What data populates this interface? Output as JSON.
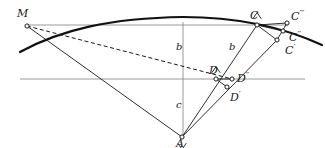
{
  "figure": {
    "width": 325,
    "height": 148,
    "background": "#ffffff",
    "ink_color": "#1a1a1a",
    "axis_color": "#808080",
    "curve_color": "#111111"
  },
  "points": {
    "M": {
      "label": "M",
      "x": 27,
      "y": 26
    },
    "A": {
      "label": "A",
      "x": 182,
      "y": 137
    },
    "C": {
      "label": "C",
      "x": 257,
      "y": 25
    },
    "Cp": {
      "label": "C′",
      "x": 277,
      "y": 40
    },
    "Cpp": {
      "label": "C″",
      "x": 283,
      "y": 31
    },
    "Cppp": {
      "label": "C‴",
      "x": 287,
      "y": 23
    },
    "D": {
      "label": "D",
      "x": 216,
      "y": 79
    },
    "Dp": {
      "label": "D′",
      "x": 227,
      "y": 87
    },
    "Dpp": {
      "label": "D″",
      "x": 232,
      "y": 79
    }
  },
  "point_labels": [
    {
      "name": "label-M",
      "text": "M",
      "primes": "",
      "x": 17,
      "y": 8
    },
    {
      "name": "label-A",
      "text": "A",
      "primes": "",
      "x": 176,
      "y": 138
    },
    {
      "name": "label-C",
      "text": "C",
      "primes": "",
      "x": 250,
      "y": 10
    },
    {
      "name": "label-Cppp",
      "text": "C",
      "primes": "′′′",
      "x": 291,
      "y": 9
    },
    {
      "name": "label-Cpp",
      "text": "C",
      "primes": "′′",
      "x": 289,
      "y": 30
    },
    {
      "name": "label-Cp",
      "text": "C",
      "primes": "′",
      "x": 285,
      "y": 43
    },
    {
      "name": "label-D",
      "text": "D",
      "primes": "",
      "x": 209,
      "y": 65
    },
    {
      "name": "label-Dpp",
      "text": "D",
      "primes": "′′",
      "x": 237,
      "y": 71
    },
    {
      "name": "label-Dp",
      "text": "D",
      "primes": "′",
      "x": 230,
      "y": 90
    }
  ],
  "segment_labels": [
    {
      "name": "label-b-vertical",
      "text": "b",
      "x": 176,
      "y": 42
    },
    {
      "name": "label-b-diagonal",
      "text": "b",
      "x": 229,
      "y": 42
    },
    {
      "name": "label-c-vertical",
      "text": "c",
      "x": 176,
      "y": 100
    }
  ],
  "axes": {
    "horizontal_top": {
      "name": "horizontal-line-through-M-C",
      "x1": 27,
      "y1": 25,
      "x2": 288,
      "y2": 25
    },
    "horizontal_bottom": {
      "name": "horizontal-line-through-D",
      "x1": 20,
      "y1": 79,
      "x2": 305,
      "y2": 79
    },
    "vertical_axis": {
      "name": "vertical-axis-through-A",
      "x1": 183,
      "y1": 22,
      "x2": 183,
      "y2": 137
    }
  },
  "curve": {
    "name": "arc-curve",
    "description": "thick concave-down arc passing left-low through apex near vertical axis and down to the right",
    "path": "M 20 52 C 60 30, 110 18, 183 17 C 240 17, 285 28, 322 45"
  },
  "solid_lines": [
    {
      "name": "line-M-to-A",
      "x1": 27,
      "y1": 26,
      "x2": 182,
      "y2": 137
    },
    {
      "name": "line-A-to-C",
      "x1": 182,
      "y1": 137,
      "x2": 257,
      "y2": 25
    },
    {
      "name": "line-A-to-Cp",
      "x1": 182,
      "y1": 137,
      "x2": 277,
      "y2": 40
    },
    {
      "name": "line-C-to-Cp",
      "x1": 257,
      "y1": 25,
      "x2": 277,
      "y2": 40
    },
    {
      "name": "line-C-to-Cpp",
      "x1": 257,
      "y1": 25,
      "x2": 283,
      "y2": 31
    },
    {
      "name": "line-C-to-Cppp",
      "x1": 257,
      "y1": 25,
      "x2": 287,
      "y2": 23
    },
    {
      "name": "line-Cp-to-Cppp",
      "x1": 277,
      "y1": 40,
      "x2": 287,
      "y2": 23
    },
    {
      "name": "line-D-to-Dpp",
      "x1": 216,
      "y1": 79,
      "x2": 232,
      "y2": 79
    },
    {
      "name": "line-D-to-Dp",
      "x1": 216,
      "y1": 79,
      "x2": 227,
      "y2": 87
    }
  ],
  "dashed_lines": [
    {
      "name": "dashed-line-M-to-D",
      "x1": 27,
      "y1": 26,
      "x2": 232,
      "y2": 79
    }
  ],
  "right_angle_marks": [
    {
      "name": "right-angle-at-A",
      "x": 182,
      "y": 137,
      "a1": 305,
      "a2": 236
    },
    {
      "name": "right-angle-at-C",
      "x": 257,
      "y": 25,
      "a1": 56,
      "a2": 123
    },
    {
      "name": "right-angle-at-D",
      "x": 216,
      "y": 79,
      "a1": 56,
      "a2": 124
    }
  ]
}
